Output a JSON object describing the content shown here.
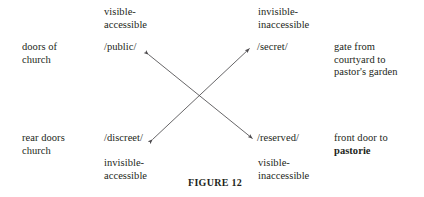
{
  "figure": {
    "caption": "FIGURE 12",
    "line_color": "#4c4a4d",
    "text_color": "#231f20",
    "background": "#ffffff"
  },
  "features": {
    "top_left": "visible-\naccessible",
    "top_right": "invisible-\ninaccessible",
    "bottom_left": "invisible-\naccessible",
    "bottom_right": "visible-\ninaccessible"
  },
  "terms": {
    "top_left": "/public/",
    "top_right": "/secret/",
    "bottom_left": "/discreet/",
    "bottom_right": "/reserved/"
  },
  "glosses": {
    "left_top": "doors of\nchurch",
    "left_bottom": "rear doors\nchurch",
    "right_top": "gate from\ncourtyard to\npastor's garden",
    "right_bottom_prefix": "front door to",
    "right_bottom_bold": "pastorie"
  },
  "relations": [
    {
      "name": "public-reserved-axis",
      "from": "/public/",
      "to": "/reserved/",
      "style": "double-headed-arrow"
    },
    {
      "name": "secret-discreet-axis",
      "from": "/secret/",
      "to": "/discreet/",
      "style": "double-headed-arrow"
    }
  ]
}
